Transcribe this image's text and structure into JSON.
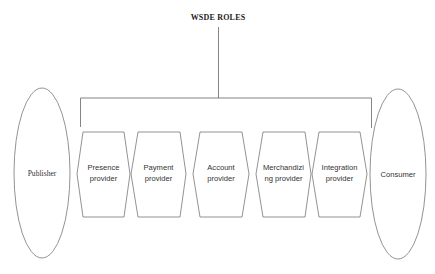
{
  "diagram": {
    "title": "WSDE ROLES",
    "left_actor": {
      "label": "Publisher"
    },
    "right_actor": {
      "label": "Consumer"
    },
    "roles": [
      {
        "line1": "Presence",
        "line2": "provider"
      },
      {
        "line1": "Payment",
        "line2": "provider"
      },
      {
        "line1": "Account",
        "line2": "provider"
      },
      {
        "line1": "Merchandizi",
        "line2": "ng provider"
      },
      {
        "line1": "Integration",
        "line2": "provider"
      }
    ],
    "colors": {
      "stroke": "#777777",
      "text": "#333333",
      "background": "#ffffff"
    }
  }
}
